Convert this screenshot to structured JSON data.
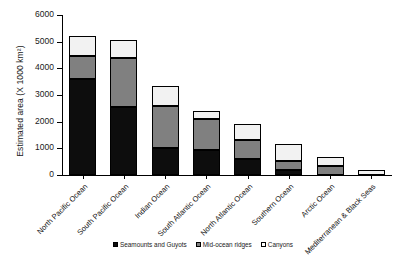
{
  "chart_data": {
    "type": "bar",
    "subtype": "stacked-vertical",
    "title": "",
    "xlabel": "",
    "ylabel": "Estimated area (X 1000 km²)",
    "ylim": [
      0,
      6000
    ],
    "yticks": [
      0,
      1000,
      2000,
      3000,
      4000,
      5000,
      6000
    ],
    "ytick_labels": [
      "0",
      "1000",
      "2000",
      "3000",
      "4000",
      "5000",
      "6000"
    ],
    "grid": false,
    "legend_position": "bottom-center",
    "categories": [
      "North Pacific Ocean",
      "South Pacific Ocean",
      "Indian Ocean",
      "South Atlantic Ocean",
      "North Atlantic Ocean",
      "Southern Ocean",
      "Arctic Ocean",
      "Mediterranean & Black Seas"
    ],
    "series": [
      {
        "name": "Seamounts and Guyots",
        "color": "#0d0d0d",
        "values": [
          3600,
          2550,
          1000,
          950,
          600,
          180,
          0,
          0
        ]
      },
      {
        "name": "Mid-ocean ridges",
        "color": "#808080",
        "values": [
          850,
          1850,
          1600,
          1150,
          700,
          350,
          330,
          0
        ]
      },
      {
        "name": "Canyons",
        "color": "#ffffff",
        "values": [
          780,
          650,
          750,
          300,
          600,
          620,
          350,
          180
        ]
      }
    ],
    "totals": [
      5230,
      5050,
      3350,
      2400,
      1900,
      1150,
      680,
      180
    ]
  },
  "legend": {
    "items": [
      {
        "label": "Seamounts and Guyots",
        "swatch": "black-square-swatch"
      },
      {
        "label": "Mid-ocean ridges",
        "swatch": "gray-square-swatch"
      },
      {
        "label": "Canyons",
        "swatch": "white-square-swatch"
      }
    ]
  },
  "caption": {
    "text": ""
  },
  "colors": {
    "seamounts": "#0d0d0d",
    "ridges": "#808080",
    "canyons": "#ffffff",
    "axis": "#000000",
    "background": "#ffffff"
  }
}
